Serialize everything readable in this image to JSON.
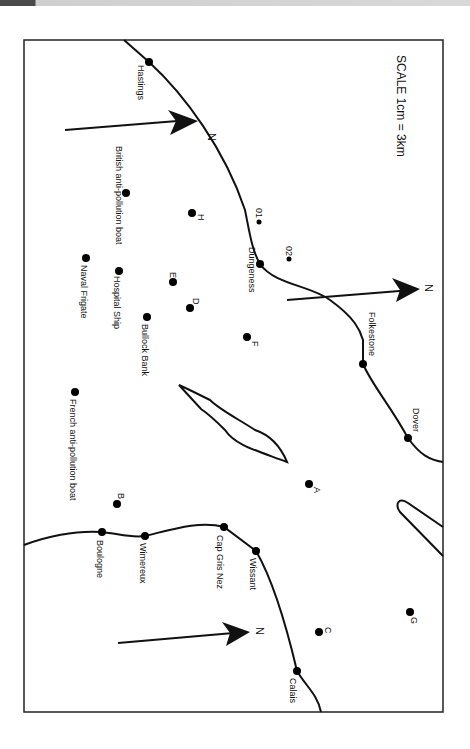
{
  "map": {
    "scale_label": "SCALE 1cm = 3km",
    "north_label": "N",
    "towns": [
      {
        "name": "Hastings",
        "x": 149,
        "y": 62
      },
      {
        "name": "Dungeness",
        "x": 260,
        "y": 264
      },
      {
        "name": "Folkestone",
        "x": 363,
        "y": 364
      },
      {
        "name": "Dover",
        "x": 408,
        "y": 438
      },
      {
        "name": "Calais",
        "x": 297,
        "y": 671
      },
      {
        "name": "Wissant",
        "x": 256,
        "y": 551
      },
      {
        "name": "Cap Gris Nez",
        "x": 224,
        "y": 527
      },
      {
        "name": "Wimereux",
        "x": 145,
        "y": 536
      },
      {
        "name": "Boulogne",
        "x": 102,
        "y": 532
      }
    ],
    "points": [
      {
        "name": "British anti-pollution boat",
        "x": 126,
        "y": 193
      },
      {
        "name": "H",
        "x": 192,
        "y": 213
      },
      {
        "name": "01",
        "x": 259,
        "y": 222
      },
      {
        "name": "02",
        "x": 289,
        "y": 259
      },
      {
        "name": "Hospital Ship",
        "x": 119,
        "y": 271
      },
      {
        "name": "Naval Frigate",
        "x": 86,
        "y": 258
      },
      {
        "name": "E",
        "x": 173,
        "y": 282
      },
      {
        "name": "D",
        "x": 190,
        "y": 308
      },
      {
        "name": "Bullock Bank",
        "x": 147,
        "y": 317
      },
      {
        "name": "F",
        "x": 247,
        "y": 337
      },
      {
        "name": "French anti-pollution boat",
        "x": 75,
        "y": 392
      },
      {
        "name": "A",
        "x": 309,
        "y": 484
      },
      {
        "name": "B",
        "x": 117,
        "y": 504
      },
      {
        "name": "C",
        "x": 319,
        "y": 632
      },
      {
        "name": "G",
        "x": 410,
        "y": 612
      }
    ]
  }
}
